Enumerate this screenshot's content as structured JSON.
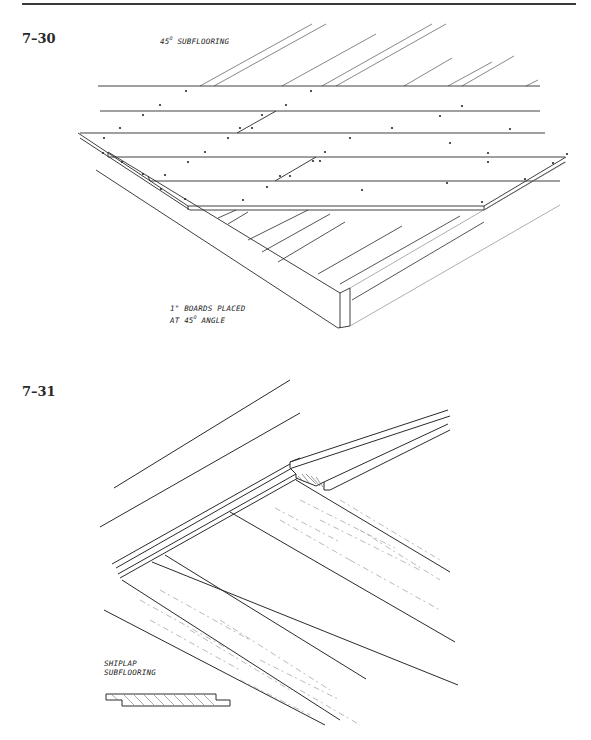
{
  "page": {
    "figures": [
      {
        "number": "7–30",
        "labels": {
          "title_prefix": "45",
          "title_degree": "O",
          "title_suffix": "SUBFLOORING",
          "note_line1": "1\" BOARDS PLACED",
          "note_line2_prefix": "AT 45",
          "note_line2_degree": "O",
          "note_line2_suffix": "ANGLE"
        },
        "description": "Isometric view of floor frame with 1-inch boards nailed diagonally at 45 degrees over joists"
      },
      {
        "number": "7–31",
        "labels": {
          "note_line1": "SHIPLAP",
          "note_line2": "SUBFLOORING"
        },
        "description": "Isometric view of shiplap subflooring boards over wood joists, with cross-section profile detail"
      }
    ]
  },
  "colors": {
    "ink": "#2a2a2a",
    "light_ink": "#8a8a8a",
    "paper": "#ffffff"
  }
}
